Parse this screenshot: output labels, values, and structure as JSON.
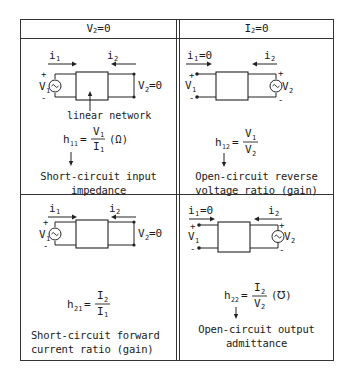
{
  "headers": {
    "left": {
      "base": "V",
      "sub": "2",
      "rest": "=0"
    },
    "right": {
      "base": "I",
      "sub": "2",
      "rest": "=0"
    }
  },
  "cells": {
    "h11": {
      "i1_label": "i",
      "i1_sub": "1",
      "i2_label": "i",
      "i2_sub": "2",
      "v1_label": "V",
      "v1_sub": "1",
      "out_label": "V",
      "out_sub": "2",
      "out_rest": "=0",
      "network_label": "linear network",
      "param": "h",
      "param_sub": "11",
      "num": "V",
      "num_sub": "1",
      "den": "I",
      "den_sub": "1",
      "unit": "(Ω)",
      "description_line1": "Short-circuit input",
      "description_line2": "impedance"
    },
    "h12": {
      "i1_label": "i",
      "i1_sub": "1",
      "i1_rest": "=0",
      "i2_label": "i",
      "i2_sub": "2",
      "v1_label": "V",
      "v1_sub": "1",
      "v2_label": "V",
      "v2_sub": "2",
      "param": "h",
      "param_sub": "12",
      "num": "V",
      "num_sub": "1",
      "den": "V",
      "den_sub": "2",
      "description_line1": "Open-circuit reverse",
      "description_line2": "voltage ratio (gain)"
    },
    "h21": {
      "i1_label": "i",
      "i1_sub": "1",
      "i2_label": "i",
      "i2_sub": "2",
      "v1_label": "V",
      "v1_sub": "1",
      "out_label": "V",
      "out_sub": "2",
      "out_rest": "=0",
      "param": "h",
      "param_sub": "21",
      "num": "I",
      "num_sub": "2",
      "den": "I",
      "den_sub": "1",
      "description_line1": "Short-circuit forward",
      "description_line2": "current ratio (gain)"
    },
    "h22": {
      "i1_label": "i",
      "i1_sub": "1",
      "i1_rest": "=0",
      "i2_label": "i",
      "i2_sub": "2",
      "v1_label": "V",
      "v1_sub": "1",
      "v2_label": "V",
      "v2_sub": "2",
      "param": "h",
      "param_sub": "22",
      "num": "I",
      "num_sub": "2",
      "den": "V",
      "den_sub": "2",
      "unit": "(℧)",
      "description_line1": "Open-circuit output",
      "description_line2": "admittance"
    }
  },
  "symbols": {
    "plus": "+",
    "minus": "-",
    "equals": "="
  }
}
